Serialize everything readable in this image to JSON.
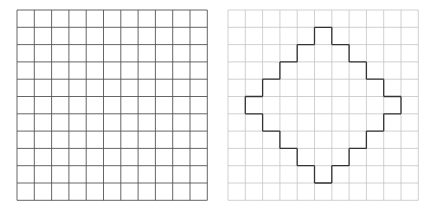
{
  "left_grid": {
    "rows": 11,
    "cols": 11,
    "x": 17,
    "y": 10,
    "cell": 17.3,
    "line_color": "#555555"
  },
  "right_grid": {
    "rows": 11,
    "cols": 11,
    "x": 228,
    "y": 10,
    "cell": 17.3,
    "line_color": "#c4c4c4",
    "shape_color": "#333333",
    "shape_rows": [
      {
        "row": 1,
        "from": 5,
        "to": 5
      },
      {
        "row": 2,
        "from": 4,
        "to": 6
      },
      {
        "row": 3,
        "from": 3,
        "to": 7
      },
      {
        "row": 4,
        "from": 2,
        "to": 8
      },
      {
        "row": 5,
        "from": 1,
        "to": 9
      },
      {
        "row": 6,
        "from": 2,
        "to": 8
      },
      {
        "row": 7,
        "from": 3,
        "to": 7
      },
      {
        "row": 8,
        "from": 4,
        "to": 6
      },
      {
        "row": 9,
        "from": 5,
        "to": 5
      }
    ]
  }
}
